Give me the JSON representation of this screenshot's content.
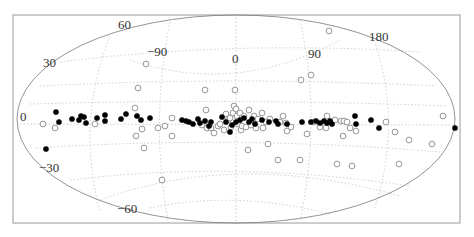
{
  "chart_data": {
    "type": "scatter",
    "projection": "Aitoff/Hammer all-sky (oblique graticule)",
    "title": "",
    "xlabel": "",
    "ylabel": "",
    "longitude_labels": [
      "-90",
      "0",
      "90",
      "180"
    ],
    "latitude_labels": [
      "60",
      "30",
      "0",
      "-30",
      "-60"
    ],
    "grid": true,
    "legend": null,
    "series": [
      {
        "name": "filled",
        "marker": "filled-circle",
        "color": "#000000",
        "points_px": [
          [
            56,
            112
          ],
          [
            59,
            122
          ],
          [
            72,
            119
          ],
          [
            84,
            117
          ],
          [
            79,
            120
          ],
          [
            81,
            116
          ],
          [
            86,
            123
          ],
          [
            97,
            118
          ],
          [
            105,
            115
          ],
          [
            105,
            121
          ],
          [
            121,
            119
          ],
          [
            126,
            114
          ],
          [
            137,
            116
          ],
          [
            141,
            120
          ],
          [
            150,
            118
          ],
          [
            182,
            120
          ],
          [
            186,
            121
          ],
          [
            189,
            122
          ],
          [
            193,
            124
          ],
          [
            198,
            119
          ],
          [
            200,
            123
          ],
          [
            205,
            121
          ],
          [
            209,
            126
          ],
          [
            211,
            122
          ],
          [
            222,
            117
          ],
          [
            226,
            122
          ],
          [
            232,
            125
          ],
          [
            236,
            122
          ],
          [
            240,
            120
          ],
          [
            244,
            118
          ],
          [
            249,
            122
          ],
          [
            252,
            119
          ],
          [
            255,
            124
          ],
          [
            262,
            120
          ],
          [
            269,
            122
          ],
          [
            276,
            121
          ],
          [
            278,
            124
          ],
          [
            287,
            124
          ],
          [
            302,
            122
          ],
          [
            311,
            122
          ],
          [
            316,
            121
          ],
          [
            320,
            123
          ],
          [
            324,
            121
          ],
          [
            327,
            123
          ],
          [
            330,
            121
          ],
          [
            332,
            124
          ],
          [
            355,
            116
          ],
          [
            356,
            124
          ],
          [
            371,
            120
          ],
          [
            379,
            128
          ],
          [
            455,
            128
          ],
          [
            46,
            149
          ],
          [
            230,
            132
          ]
        ]
      },
      {
        "name": "open",
        "marker": "open-circle",
        "color": "#8a8a8a",
        "points_px": [
          [
            43,
            124
          ],
          [
            55,
            128
          ],
          [
            95,
            124
          ],
          [
            135,
            108
          ],
          [
            142,
            129
          ],
          [
            158,
            128
          ],
          [
            165,
            126
          ],
          [
            172,
            118
          ],
          [
            172,
            136
          ],
          [
            202,
            125
          ],
          [
            207,
            128
          ],
          [
            206,
            110
          ],
          [
            211,
            128
          ],
          [
            214,
            133
          ],
          [
            218,
            126
          ],
          [
            220,
            124
          ],
          [
            224,
            130
          ],
          [
            226,
            114
          ],
          [
            228,
            120
          ],
          [
            230,
            118
          ],
          [
            231,
            127
          ],
          [
            233,
            113
          ],
          [
            234,
            106
          ],
          [
            236,
            109
          ],
          [
            237,
            116
          ],
          [
            238,
            124
          ],
          [
            240,
            113
          ],
          [
            241,
            130
          ],
          [
            242,
            126
          ],
          [
            244,
            116
          ],
          [
            246,
            127
          ],
          [
            249,
            110
          ],
          [
            251,
            125
          ],
          [
            254,
            116
          ],
          [
            256,
            128
          ],
          [
            258,
            119
          ],
          [
            262,
            113
          ],
          [
            263,
            128
          ],
          [
            266,
            122
          ],
          [
            270,
            119
          ],
          [
            280,
            122
          ],
          [
            283,
            116
          ],
          [
            286,
            123
          ],
          [
            287,
            131
          ],
          [
            291,
            127
          ],
          [
            307,
            134
          ],
          [
            314,
            122
          ],
          [
            320,
            127
          ],
          [
            326,
            128
          ],
          [
            327,
            116
          ],
          [
            335,
            120
          ],
          [
            341,
            121
          ],
          [
            344,
            121
          ],
          [
            347,
            122
          ],
          [
            350,
            128
          ],
          [
            343,
            136
          ],
          [
            356,
            131
          ],
          [
            386,
            122
          ],
          [
            395,
            132
          ],
          [
            399,
            164
          ],
          [
            409,
            140
          ],
          [
            432,
            144
          ],
          [
            443,
            116
          ],
          [
            301,
            80
          ],
          [
            311,
            75
          ],
          [
            146,
            64
          ],
          [
            205,
            90
          ],
          [
            235,
            90
          ],
          [
            300,
            160
          ],
          [
            278,
            160
          ],
          [
            162,
            180
          ],
          [
            352,
            166
          ],
          [
            337,
            164
          ],
          [
            268,
            144
          ],
          [
            248,
            150
          ],
          [
            138,
            88
          ],
          [
            329,
            31
          ],
          [
            136,
            136
          ],
          [
            144,
            148
          ]
        ]
      }
    ]
  },
  "labels": {
    "lat_60": "60",
    "lat_30": "30",
    "lat_0": "0",
    "lat_m30": "−30",
    "lat_m60": "−60",
    "lon_m90": "−90",
    "lon_0": "0",
    "lon_90": "90",
    "lon_180": "180"
  }
}
